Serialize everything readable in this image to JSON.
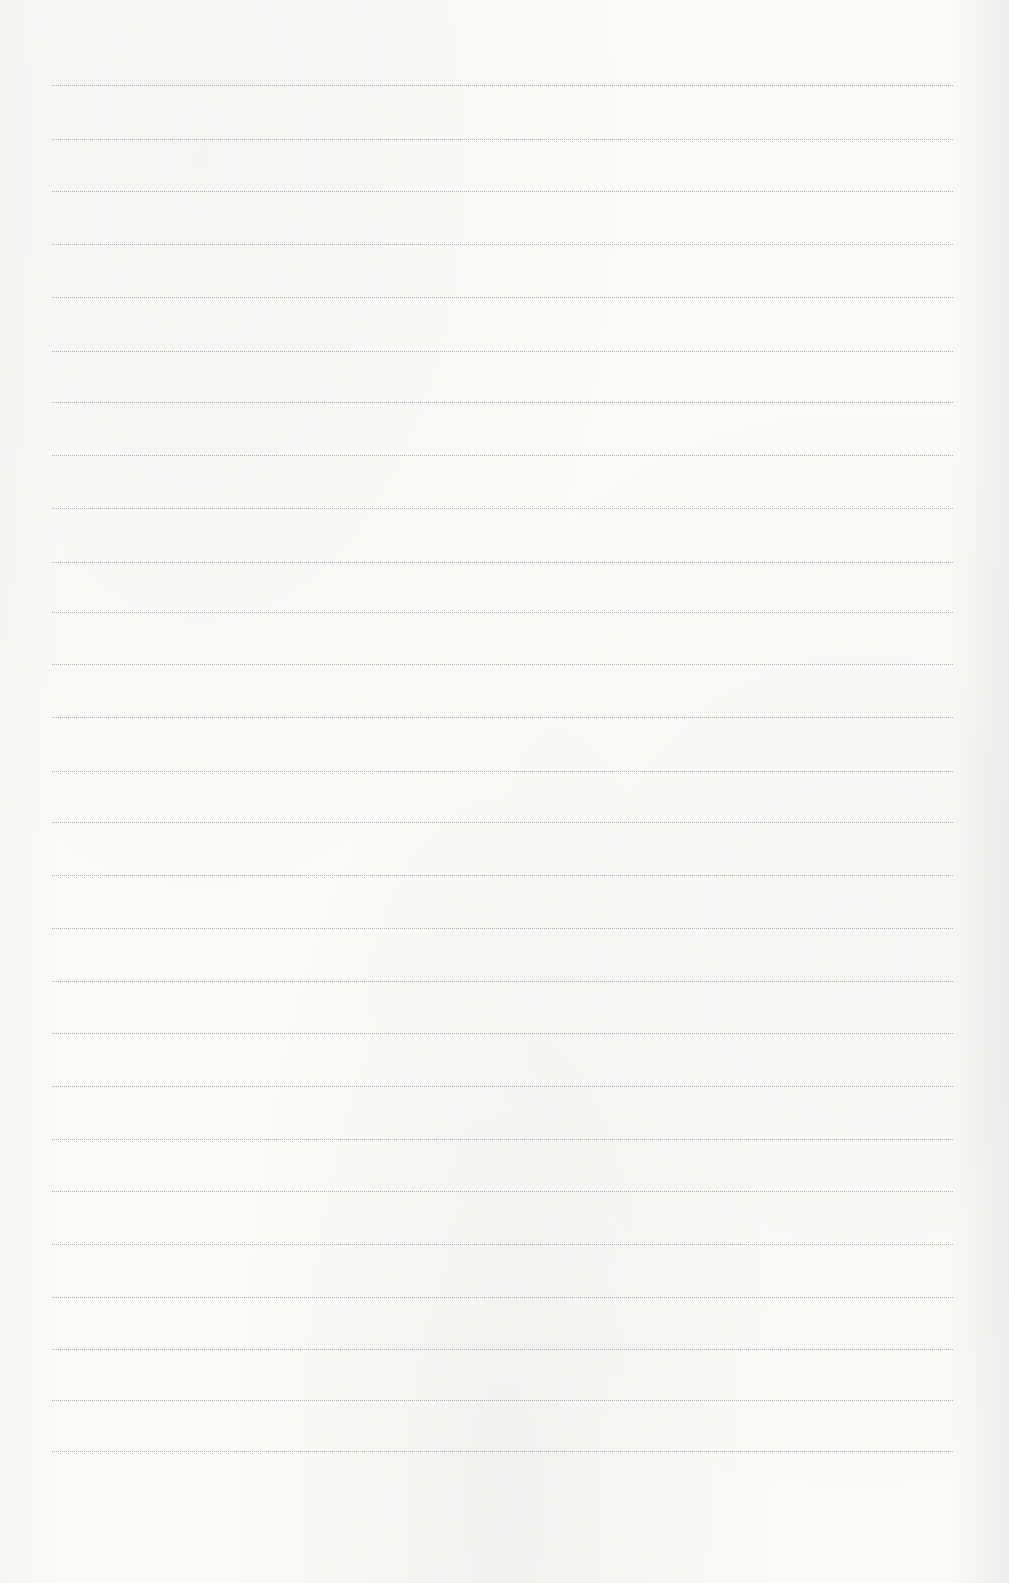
{
  "document": {
    "type": "blank lined paper",
    "line_count": 27,
    "line_positions_y": [
      85,
      139,
      191,
      244,
      297,
      351,
      402,
      455,
      508,
      562,
      612,
      664,
      717,
      771,
      822,
      875,
      928,
      981,
      1033,
      1086,
      1139,
      1191,
      1244,
      1297,
      1349,
      1400,
      1451
    ],
    "line_left_x": 52,
    "line_right_x": 953,
    "colors": {
      "paper": "#fafaf9",
      "rule": "#9a9a9a"
    }
  }
}
